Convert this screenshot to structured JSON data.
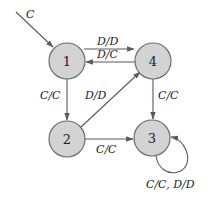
{
  "diagram": {
    "type": "state-machine",
    "start": {
      "label": "C",
      "target": "1"
    },
    "states": [
      {
        "id": "1",
        "label": "1"
      },
      {
        "id": "2",
        "label": "2"
      },
      {
        "id": "3",
        "label": "3"
      },
      {
        "id": "4",
        "label": "4"
      }
    ],
    "transitions": [
      {
        "from": "1",
        "to": "4",
        "label": "D/D"
      },
      {
        "from": "4",
        "to": "1",
        "label": "D/C"
      },
      {
        "from": "1",
        "to": "2",
        "label": "C/C"
      },
      {
        "from": "2",
        "to": "4",
        "label": "D/D"
      },
      {
        "from": "4",
        "to": "3",
        "label": "C/C"
      },
      {
        "from": "2",
        "to": "3",
        "label": "C/C"
      },
      {
        "from": "3",
        "to": "3",
        "label": "C/C, D/D"
      }
    ],
    "colors": {
      "state_fill": "#d3d3d3",
      "state_stroke": "#6e6e6e",
      "edge": "#5a5a5a"
    }
  }
}
